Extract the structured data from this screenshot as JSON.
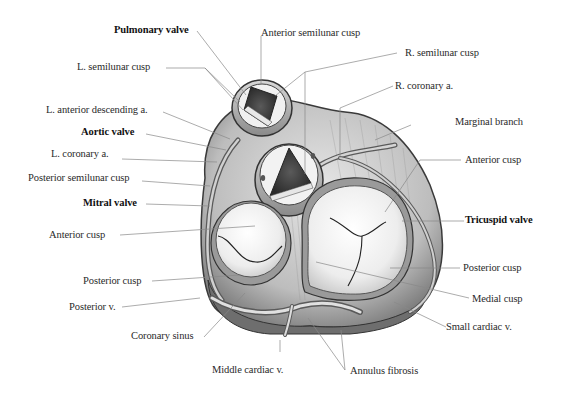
{
  "figure": {
    "background_color": "#ffffff",
    "line_color": "#888888"
  },
  "labels": {
    "pulmonary_valve": "Pulmonary valve",
    "anterior_semilunar_cusp": "Anterior semilunar cusp",
    "r_semilunar_cusp": "R. semilunar cusp",
    "l_semilunar_cusp": "L. semilunar cusp",
    "r_coronary_a": "R. coronary a.",
    "l_anterior_descending_a": "L. anterior descending a.",
    "marginal_branch": "Marginal branch",
    "aortic_valve": "Aortic valve",
    "l_coronary_a": "L. coronary a.",
    "anterior_cusp_tricuspid": "Anterior cusp",
    "posterior_semilunar_cusp": "Posterior semilunar cusp",
    "mitral_valve": "Mitral valve",
    "tricuspid_valve": "Tricuspid valve",
    "anterior_cusp_mitral": "Anterior cusp",
    "posterior_cusp_mitral": "Posterior cusp",
    "posterior_cusp_tricuspid": "Posterior cusp",
    "posterior_v": "Posterior v.",
    "medial_cusp": "Medial cusp",
    "coronary_sinus": "Coronary sinus",
    "small_cardiac_v": "Small cardiac v.",
    "middle_cardiac_v": "Middle cardiac v.",
    "annulus_fibrosis": "Annulus fibrosis"
  }
}
